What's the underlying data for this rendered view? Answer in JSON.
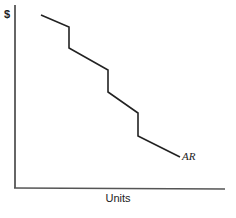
{
  "chart_data": {
    "type": "line",
    "title": "",
    "xlabel": "Units",
    "ylabel": "$",
    "grid": false,
    "legend": null,
    "series": [
      {
        "name": "AR",
        "label": "AR",
        "style": "stepped kinked demand curve (average revenue)",
        "points_px": [
          [
            41,
            15
          ],
          [
            69,
            27
          ],
          [
            69,
            48
          ],
          [
            108,
            70
          ],
          [
            108,
            92
          ],
          [
            138,
            113
          ],
          [
            138,
            136
          ],
          [
            180,
            157
          ]
        ]
      }
    ],
    "annotations": [
      {
        "text": "AR",
        "position": "end of curve"
      }
    ]
  },
  "axes": {
    "y_label": "$",
    "x_label": "Units"
  },
  "curve": {
    "label": "AR",
    "color": "#222222"
  }
}
